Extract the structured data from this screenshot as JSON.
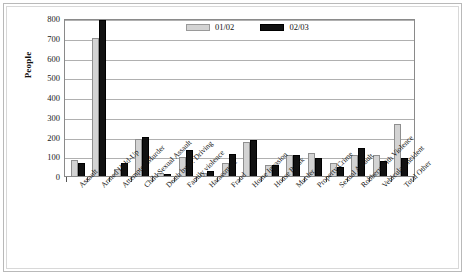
{
  "chart_data": {
    "type": "bar",
    "title": "",
    "xlabel": "",
    "ylabel": "People",
    "ylim": [
      0,
      800
    ],
    "yticks": [
      0,
      100,
      200,
      300,
      400,
      500,
      600,
      700,
      800
    ],
    "grid": true,
    "legend_position": "top-center",
    "categories": [
      "Assault",
      "Armed Hold-Up",
      "Attempted Murder",
      "Child Sexual Assault",
      "Death by D. Driving",
      "Family violence",
      "Harassment",
      "Fraud",
      "Home Invasion",
      "House Break",
      "Murder",
      "Property Crime",
      "Sexual Assault",
      "Robbery with Violence",
      "Vehicular Incident",
      "Total Other"
    ],
    "series": [
      {
        "name": "01/02",
        "color": "#d3d3d3",
        "values": [
          80,
          700,
          38,
          185,
          15,
          95,
          13,
          68,
          172,
          57,
          106,
          117,
          68,
          104,
          104,
          262
        ]
      },
      {
        "name": "02/03",
        "color": "#111111",
        "values": [
          65,
          790,
          68,
          200,
          12,
          130,
          27,
          112,
          180,
          55,
          108,
          93,
          47,
          142,
          76,
          93
        ]
      }
    ]
  },
  "legend": {
    "items": [
      {
        "label": "01/02",
        "swatch": "legend-swatch-gray"
      },
      {
        "label": "02/03",
        "swatch": "legend-swatch-black"
      }
    ]
  }
}
